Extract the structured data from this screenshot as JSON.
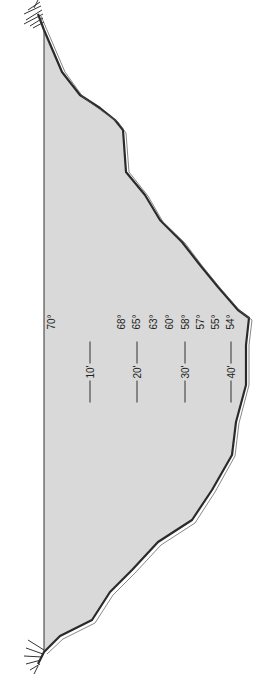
{
  "diagram": {
    "type": "lake-cross-section",
    "orientation": "rotated-90-ccw",
    "colors": {
      "water": "#d9d9d9",
      "outline": "#2a2a2a",
      "background": "#ffffff"
    },
    "surface_temperature": "70°",
    "temperatures": [
      "68°",
      "65°",
      "63°",
      "60°",
      "58°",
      "57°",
      "55°",
      "54°"
    ],
    "depths": [
      "10'",
      "20'",
      "30'",
      "40'"
    ]
  }
}
